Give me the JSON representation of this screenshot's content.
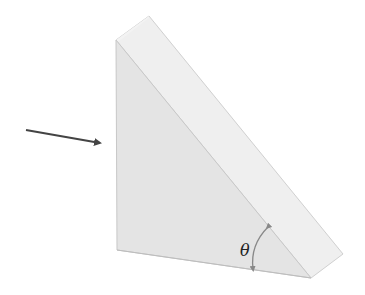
{
  "diagram": {
    "type": "triangular-prism",
    "labels": {
      "angle": "θ"
    },
    "colors": {
      "front_face": "#e6e6e6",
      "slanted_face": "#efefef",
      "edge": "#c8c8c8",
      "arrow": "#444444",
      "angle_arc": "#888888"
    },
    "elements": [
      "incident-arrow",
      "prism-front-face",
      "prism-hypotenuse-face",
      "angle-arc",
      "theta-label"
    ]
  }
}
